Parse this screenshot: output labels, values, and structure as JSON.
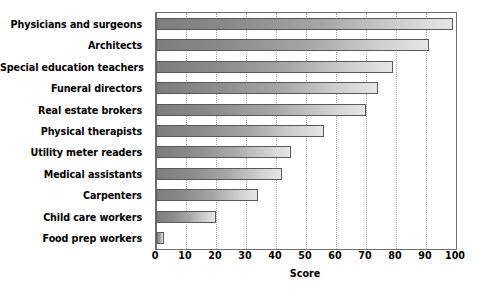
{
  "chart_data": {
    "type": "bar",
    "orientation": "horizontal",
    "title": "",
    "subtitle": "",
    "xlabel": "Score",
    "ylabel": "",
    "xlim": [
      0,
      100
    ],
    "xticks": [
      0,
      10,
      20,
      30,
      40,
      50,
      60,
      70,
      80,
      90,
      100
    ],
    "xtick_labels": [
      "0",
      "10",
      "20",
      "30",
      "40",
      "50",
      "60",
      "70",
      "80",
      "90",
      "100"
    ],
    "grid": true,
    "grid_axis": "x",
    "grid_style": "dotted",
    "legend": null,
    "legend_position": "none",
    "categories": [
      "Physicians and surgeons",
      "Architects",
      "Special education teachers",
      "Funeral directors",
      "Real estate brokers",
      "Physical therapists",
      "Utility meter readers",
      "Medical assistants",
      "Carpenters",
      "Child care workers",
      "Food prep workers"
    ],
    "values": [
      99,
      91,
      79,
      74,
      70,
      56,
      45,
      42,
      34,
      20,
      2.5
    ],
    "bar_fill": "gradient-gray",
    "bar_edge_color": "#5a5a5a",
    "background_color": "#ffffff",
    "frame_color": "#6f6f6f"
  },
  "axis": {
    "x_title": "Score"
  }
}
